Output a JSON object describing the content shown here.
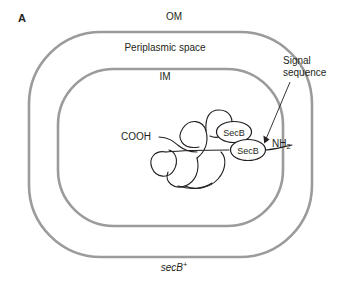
{
  "figure": {
    "panel_label": "A",
    "genotype": {
      "gene": "secB",
      "superscript": "+"
    },
    "background_color": "#ffffff"
  },
  "membranes": {
    "outer": {
      "label": "OM",
      "name": "outer-membrane",
      "color": "#9b9b9b",
      "stroke_width": 2.6
    },
    "inner": {
      "label": "IM",
      "name": "inner-membrane",
      "color": "#9b9b9b",
      "stroke_width": 2.6
    }
  },
  "compartments": {
    "periplasm_label": "Periplasmic space"
  },
  "annotations": {
    "signal_sequence": {
      "line1": "Signal",
      "line2": "sequence"
    },
    "c_terminus": "COOH",
    "n_terminus": {
      "text": "NH",
      "subscript": "2"
    }
  },
  "chaperones": [
    {
      "label": "SecB",
      "cx": 234,
      "cy": 132,
      "rx": 17.5,
      "ry": 10.5
    },
    {
      "label": "SecB",
      "cx": 248,
      "cy": 150,
      "rx": 17.5,
      "ry": 10.5
    }
  ],
  "colors": {
    "membrane_gray": "#9b9b9b",
    "chain_black": "#231f20",
    "text_black": "#231f20"
  }
}
